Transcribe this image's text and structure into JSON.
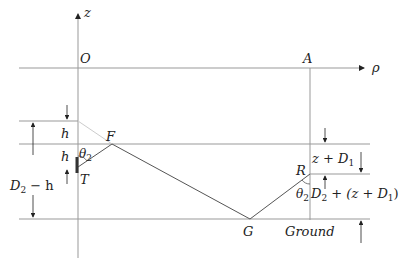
{
  "diagram": {
    "axes": {
      "z_label": "z",
      "rho_label": "ρ",
      "origin_label": "O"
    },
    "points": {
      "A": "A",
      "F": "F",
      "T": "T",
      "R": "R",
      "G": "G"
    },
    "angles": {
      "theta_T": "θ",
      "theta_T_sub": "2",
      "theta_R": "θ",
      "theta_R_sub": "2"
    },
    "dimensions": {
      "h_top": "h",
      "h_bottom": "h",
      "D2_minus_h": {
        "D": "D",
        "sub": "2",
        "rest": " − h"
      },
      "z_plus_D1": {
        "pre": "z + D",
        "sub": "1"
      },
      "D2_plus": {
        "D": "D",
        "sub": "2",
        "mid": " + (z + D",
        "sub2": "1",
        "end": ")"
      }
    },
    "ground_label": "Ground"
  }
}
